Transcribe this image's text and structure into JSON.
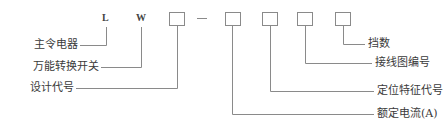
{
  "codes": {
    "letter1": "L",
    "letter2": "W",
    "dash": "—"
  },
  "left_labels": {
    "l_meaning": "主令电器",
    "w_meaning": "万能转换开关",
    "design": "设计代号"
  },
  "right_labels": {
    "positions": "挡数",
    "wiring": "接线图编号",
    "positioning": "定位特征代号",
    "rated_current": "额定电流(A)"
  },
  "colors": {
    "line": "#888888",
    "text": "#3a3a3a"
  }
}
